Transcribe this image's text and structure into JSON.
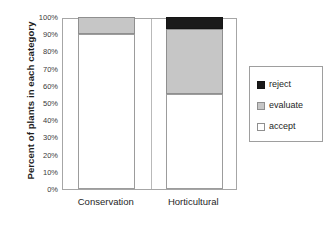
{
  "chart_data": {
    "type": "bar",
    "stacked": true,
    "title": "",
    "subtitle": "",
    "xlabel": "",
    "ylabel": "Percent of plants in each category",
    "categories": [
      "Conservation",
      "Horticultural"
    ],
    "ylim": [
      0,
      100
    ],
    "ytick_labels": [
      "0%",
      "10%",
      "20%",
      "30%",
      "40%",
      "50%",
      "60%",
      "70%",
      "80%",
      "90%",
      "100%"
    ],
    "ytick_values": [
      0,
      10,
      20,
      30,
      40,
      50,
      60,
      70,
      80,
      90,
      100
    ],
    "grid": false,
    "legend_position": "right",
    "series": [
      {
        "name": "reject",
        "color": "#1a1a1a",
        "values": [
          0,
          7
        ]
      },
      {
        "name": "evaluate",
        "color": "#c6c6c6",
        "values": [
          10,
          38
        ]
      },
      {
        "name": "accept",
        "color": "#ffffff",
        "values": [
          90,
          55
        ]
      }
    ],
    "stack_order_top_to_bottom": [
      "reject",
      "evaluate",
      "accept"
    ]
  },
  "axis": {
    "y_title": "Percent of plants in each category",
    "y_ticks": [
      {
        "label": "100%",
        "value": 100
      },
      {
        "label": "90%",
        "value": 90
      },
      {
        "label": "80%",
        "value": 80
      },
      {
        "label": "70%",
        "value": 70
      },
      {
        "label": "60%",
        "value": 60
      },
      {
        "label": "50%",
        "value": 50
      },
      {
        "label": "40%",
        "value": 40
      },
      {
        "label": "30%",
        "value": 30
      },
      {
        "label": "20%",
        "value": 20
      },
      {
        "label": "10%",
        "value": 10
      },
      {
        "label": "0%",
        "value": 0
      }
    ],
    "x_ticks": [
      {
        "label": "Conservation"
      },
      {
        "label": "Horticultural"
      }
    ]
  },
  "legend": {
    "items": [
      {
        "label": "reject",
        "color": "#1a1a1a"
      },
      {
        "label": "evaluate",
        "color": "#c6c6c6"
      },
      {
        "label": "accept",
        "color": "#ffffff"
      }
    ]
  }
}
